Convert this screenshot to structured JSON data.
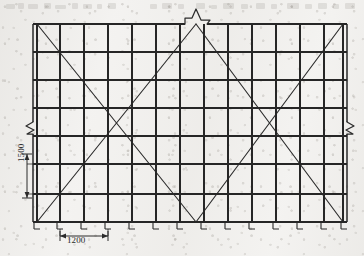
{
  "drawing": {
    "type": "scaffolding-elevation",
    "description": "Scanned line drawing: elevation view of a tube-and-coupler / frame scaffold with repeating bays, multiple lift levels and diagonal cross bracing",
    "ink_color": "#262626",
    "paper_color": "#f3f2f0",
    "canvas": {
      "width": 364,
      "height": 256
    },
    "frame": {
      "left_x": 33,
      "right_x": 347,
      "top_y": 24,
      "bottom_y": 222,
      "double_post_offset": 4
    },
    "bays": {
      "count": 13,
      "width_label": "1200",
      "post_x": [
        37,
        60,
        84,
        108,
        132,
        156,
        180,
        204,
        228,
        252,
        276,
        300,
        324,
        343
      ]
    },
    "lifts": {
      "count": 7,
      "height_label": "1500",
      "ledger_y": [
        24,
        52,
        80,
        108,
        136,
        164,
        194,
        222
      ]
    },
    "bracing": {
      "style": "cross-bracing-X",
      "panels": 2,
      "note": "Two full-height X braces, one in the left half and one mirrored in the right half, apexing at the centre break"
    },
    "break_symbols": [
      {
        "name": "left-break",
        "x": 33,
        "y": 128,
        "orientation": "vertical-line"
      },
      {
        "name": "right-break",
        "x": 347,
        "y": 128,
        "orientation": "vertical-line"
      },
      {
        "name": "top-center-break",
        "x": 196,
        "y": 24,
        "orientation": "horizontal-line"
      }
    ],
    "base_plates": {
      "count": 13,
      "note": "Small base plate / adjustable jack marks beneath each standard at the bottom rail"
    }
  },
  "dimensions": {
    "vertical": {
      "label": "1500",
      "unit": "mm",
      "meaning": "lift height between ledger levels",
      "orientation": "vertical",
      "arrow_top_y": 154,
      "arrow_bottom_y": 198,
      "x": 27
    },
    "horizontal": {
      "label": "1200",
      "unit": "mm",
      "meaning": "bay width between standards",
      "orientation": "horizontal",
      "arrow_left_x": 60,
      "arrow_right_x": 108,
      "y": 236
    }
  }
}
